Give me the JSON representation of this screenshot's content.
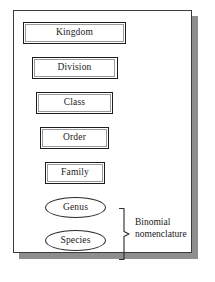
{
  "diagram": {
    "card": {
      "background": "#ffffff",
      "border_color": "#3b3b3b",
      "shadow_color": "#8e8e8e"
    },
    "ranks": [
      {
        "label": "Kingdom",
        "shape": "rectangle",
        "x": 22,
        "y": 21,
        "w": 103,
        "h": 22
      },
      {
        "label": "Division",
        "shape": "rectangle",
        "x": 30.5,
        "y": 56,
        "w": 86,
        "h": 22
      },
      {
        "label": "Class",
        "shape": "rectangle",
        "x": 35,
        "y": 91,
        "w": 77,
        "h": 22
      },
      {
        "label": "Order",
        "shape": "rectangle",
        "x": 39,
        "y": 126,
        "w": 69,
        "h": 22
      },
      {
        "label": "Family",
        "shape": "rectangle",
        "x": 44,
        "y": 161,
        "w": 60,
        "h": 22
      },
      {
        "label": "Genus",
        "shape": "ellipse",
        "x": 44,
        "y": 196,
        "w": 60,
        "h": 21
      },
      {
        "label": "Species",
        "shape": "ellipse",
        "x": 44,
        "y": 229,
        "w": 60,
        "h": 21
      }
    ],
    "brace": {
      "name": "curly-brace",
      "color": "#2b2b2b"
    },
    "annotation": {
      "line1": "Binomial",
      "line2": "nomenclature"
    }
  }
}
